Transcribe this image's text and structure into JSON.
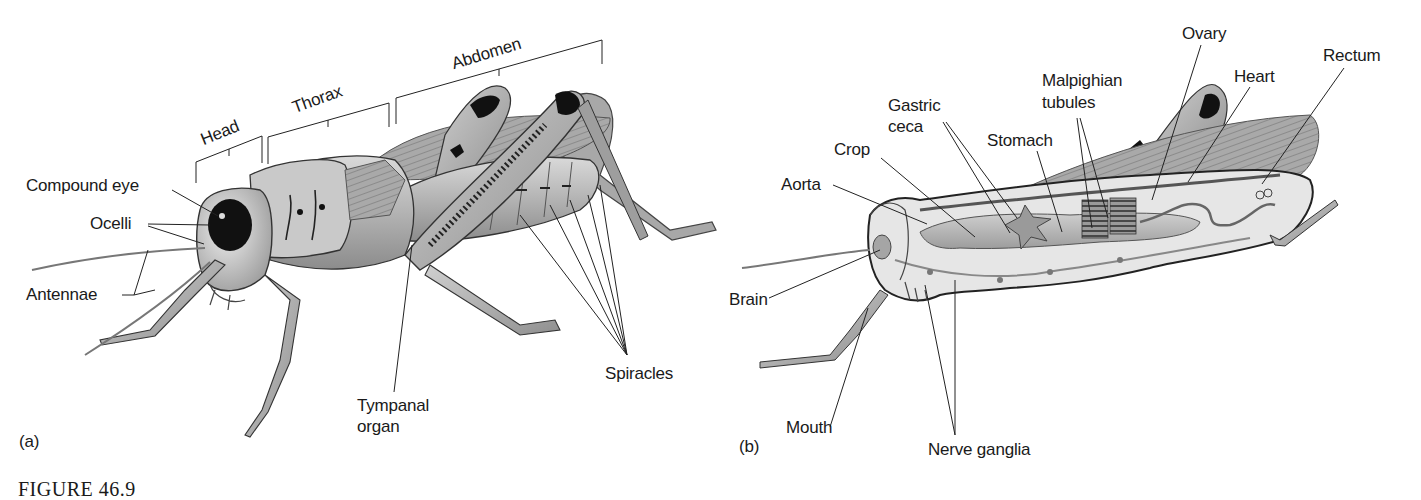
{
  "figure": {
    "caption_partial": "FIGURE 46.9",
    "panels": [
      {
        "id": "a",
        "panel_label": "(a)",
        "subject": "Grasshopper external anatomy",
        "region_brackets": {
          "head": "Head",
          "thorax": "Thorax",
          "abdomen": "Abdomen"
        },
        "labels": {
          "compound_eye": "Compound eye",
          "ocelli": "Ocelli",
          "antennae": "Antennae",
          "tympanal_organ_line1": "Tympanal",
          "tympanal_organ_line2": "organ",
          "spiracles": "Spiracles"
        }
      },
      {
        "id": "b",
        "panel_label": "(b)",
        "subject": "Grasshopper internal anatomy",
        "labels": {
          "aorta": "Aorta",
          "crop": "Crop",
          "gastric_ceca_line1": "Gastric",
          "gastric_ceca_line2": "ceca",
          "stomach": "Stomach",
          "malpighian_line1": "Malpighian",
          "malpighian_line2": "tubules",
          "ovary": "Ovary",
          "heart": "Heart",
          "rectum": "Rectum",
          "brain": "Brain",
          "mouth": "Mouth",
          "nerve_ganglia": "Nerve ganglia"
        }
      }
    ]
  }
}
